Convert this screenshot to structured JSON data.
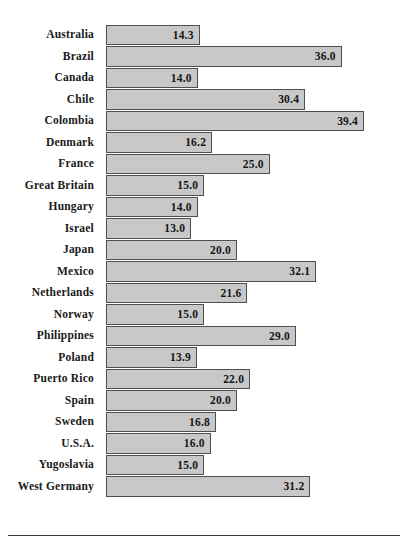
{
  "chart_data": {
    "type": "bar",
    "orientation": "horizontal",
    "title": "",
    "subtitle": "",
    "xlabel": "",
    "ylabel": "",
    "xlim": [
      0,
      41
    ],
    "grid": false,
    "legend": null,
    "value_labels_inside_bars": true,
    "value_label_format": "one-decimal",
    "categories": [
      "Australia",
      "Brazil",
      "Canada",
      "Chile",
      "Colombia",
      "Denmark",
      "France",
      "Great Britain",
      "Hungary",
      "Israel",
      "Japan",
      "Mexico",
      "Netherlands",
      "Norway",
      "Philippines",
      "Poland",
      "Puerto Rico",
      "Spain",
      "Sweden",
      "U.S.A.",
      "Yugoslavia",
      "West Germany"
    ],
    "values": [
      14.3,
      36.0,
      14.0,
      30.4,
      39.4,
      16.2,
      25.0,
      15.0,
      14.0,
      13.0,
      20.0,
      32.1,
      21.6,
      15.0,
      29.0,
      13.9,
      22.0,
      20.0,
      16.8,
      16.0,
      15.0,
      31.2
    ],
    "value_text": [
      "14.3",
      "36.0",
      "14.0",
      "30.4",
      "39.4",
      "16.2",
      "25.0",
      "15.0",
      "14.0",
      "13.0",
      "20.0",
      "32.1",
      "21.6",
      "15.0",
      "29.0",
      "13.9",
      "22.0",
      "20.0",
      "16.8",
      "16.0",
      "15.0",
      "31.2"
    ]
  },
  "style": {
    "bar_fill": "#c8c8c8",
    "bar_border": "#4f4f4f",
    "text_color": "#1a1a1a",
    "rule_color": "#3a3a3a",
    "background": "#ffffff"
  },
  "layout": {
    "bar_origin_px": 106,
    "px_per_unit": 6.55,
    "row_height_px": 21.5
  }
}
